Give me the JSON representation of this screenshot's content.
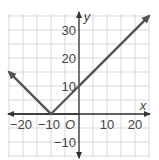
{
  "chart_data": {
    "type": "line",
    "title": "",
    "function": "y = |x + 10|",
    "xlabel": "x",
    "ylabel": "y",
    "origin_label": "O",
    "xlim": [
      -25,
      25
    ],
    "ylim": [
      -15,
      35
    ],
    "grid": true,
    "grid_step": 5,
    "x_ticks": [
      -20,
      -10,
      10,
      20
    ],
    "x_tick_labels": [
      "−20",
      "−10",
      "10",
      "20"
    ],
    "y_ticks": [
      -10,
      10,
      20,
      30
    ],
    "y_tick_labels": [
      "−10",
      "10",
      "20",
      "30"
    ],
    "series": [
      {
        "name": "y = |x + 10|",
        "points": [
          [
            -25,
            15
          ],
          [
            -10,
            0
          ],
          [
            0,
            10
          ],
          [
            25,
            35
          ]
        ],
        "color": "#555555",
        "arrows_at_ends": true
      }
    ],
    "vertex": [
      -10,
      0
    ],
    "y_intercept": [
      0,
      10
    ]
  },
  "colors": {
    "grid": "#d9d9d9",
    "axis": "#333333",
    "line": "#555555"
  }
}
